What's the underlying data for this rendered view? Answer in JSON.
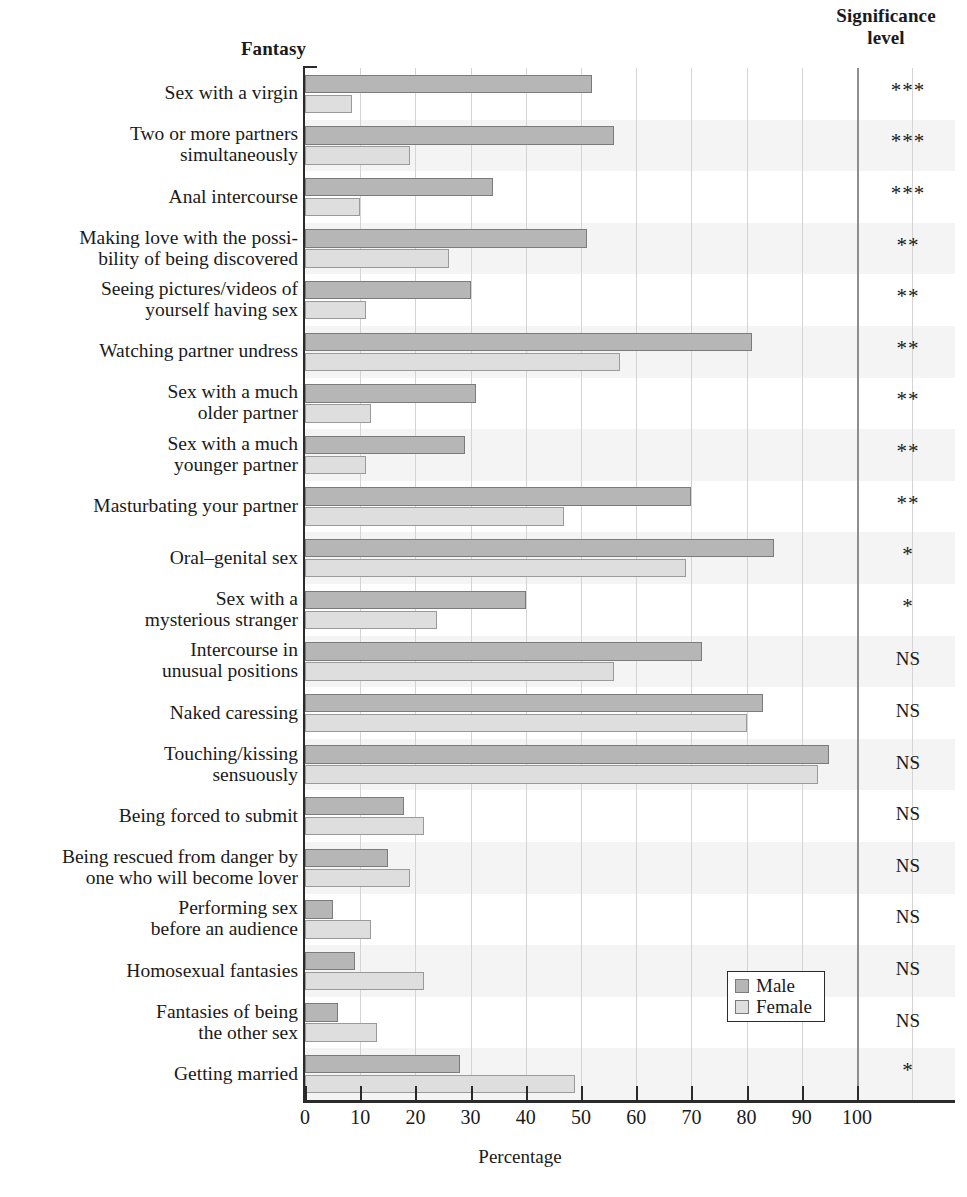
{
  "headers": {
    "fantasy": "Fantasy",
    "significance": "Significance\nlevel",
    "significance_line1": "Significance",
    "significance_line2": "level"
  },
  "legend": {
    "male": "Male",
    "female": "Female"
  },
  "axis": {
    "x_title": "Percentage",
    "ticks": [
      "0",
      "10",
      "20",
      "30",
      "40",
      "50",
      "60",
      "70",
      "80",
      "90",
      "100"
    ]
  },
  "colors": {
    "male_fill": "#b6b6b6",
    "female_fill": "#dedede",
    "band_dark": "#e9e9e9",
    "band_light": "#f4f4f4",
    "axis": "#2b2b2b",
    "grid": "#d4d4d4",
    "grid_major": "#8e8e8e"
  },
  "chart_data": {
    "type": "bar",
    "orientation": "horizontal",
    "title": "",
    "xlabel": "Percentage",
    "ylabel": "Fantasy",
    "xlim": [
      0,
      118
    ],
    "xticks": [
      0,
      10,
      20,
      30,
      40,
      50,
      60,
      70,
      80,
      90,
      100
    ],
    "grid": true,
    "grid_axis": "x",
    "legend_position": "bottom-right",
    "extra_column": "Significance level",
    "categories": [
      "Sex with a virgin",
      "Two or more partners simultaneously",
      "Anal intercourse",
      "Making love with the possibility of being discovered",
      "Seeing pictures/videos of yourself having sex",
      "Watching partner undress",
      "Sex with a much older partner",
      "Sex with a much younger partner",
      "Masturbating your partner",
      "Oral–genital sex",
      "Sex with a mysterious stranger",
      "Intercourse in unusual positions",
      "Naked caressing",
      "Touching/kissing sensuously",
      "Being forced to submit",
      "Being rescued from danger by one who will become lover",
      "Performing sex before an audience",
      "Homosexual fantasies",
      "Fantasies of being the other sex",
      "Getting married"
    ],
    "category_lines": [
      [
        "Sex with a virgin"
      ],
      [
        "Two or more partners",
        "simultaneously"
      ],
      [
        "Anal intercourse"
      ],
      [
        "Making love with the possi-",
        "bility of being discovered"
      ],
      [
        "Seeing pictures/videos of",
        "yourself having sex"
      ],
      [
        "Watching partner undress"
      ],
      [
        "Sex with a much",
        "older partner"
      ],
      [
        "Sex with a much",
        "younger partner"
      ],
      [
        "Masturbating your partner"
      ],
      [
        "Oral–genital sex"
      ],
      [
        "Sex with a",
        "mysterious stranger"
      ],
      [
        "Intercourse in",
        "unusual positions"
      ],
      [
        "Naked caressing"
      ],
      [
        "Touching/kissing",
        "sensuously"
      ],
      [
        "Being forced to submit"
      ],
      [
        "Being rescued from danger by",
        "one who will become lover"
      ],
      [
        "Performing sex",
        "before an audience"
      ],
      [
        "Homosexual fantasies"
      ],
      [
        "Fantasies of being",
        "the other sex"
      ],
      [
        "Getting married"
      ]
    ],
    "series": [
      {
        "name": "Male",
        "values": [
          52,
          56,
          34,
          51,
          30,
          81,
          31,
          29,
          70,
          85,
          40,
          72,
          83,
          95,
          18,
          15,
          5,
          9,
          6,
          28
        ]
      },
      {
        "name": "Female",
        "values": [
          8.5,
          19,
          10,
          26,
          11,
          57,
          12,
          11,
          47,
          69,
          24,
          56,
          80,
          93,
          21.5,
          19,
          12,
          21.5,
          13,
          49
        ]
      }
    ],
    "significance": [
      "***",
      "***",
      "***",
      "**",
      "**",
      "**",
      "**",
      "**",
      "**",
      "*",
      "*",
      "NS",
      "NS",
      "NS",
      "NS",
      "NS",
      "NS",
      "NS",
      "NS",
      "*"
    ]
  }
}
